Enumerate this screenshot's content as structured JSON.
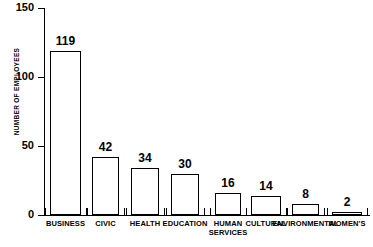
{
  "chart_data": {
    "type": "bar",
    "title": "",
    "xlabel": "",
    "ylabel": "NUMBER OF EMPLOYEES",
    "ylim": [
      0,
      150
    ],
    "yticks": [
      0,
      50,
      100,
      150
    ],
    "grid": false,
    "legend": false,
    "categories": [
      "BUSINESS",
      "CIVIC",
      "HEALTH",
      "EDUCATION",
      "HUMAN SERVICES",
      "CULTURAL",
      "ENVIRONMENTAL",
      "WOMEN'S"
    ],
    "category_lines": [
      [
        "BUSINESS"
      ],
      [
        "CIVIC"
      ],
      [
        "HEALTH"
      ],
      [
        "EDUCATION"
      ],
      [
        "HUMAN",
        "SERVICES"
      ],
      [
        "CULTURAL"
      ],
      [
        "ENVIRONMENTAL"
      ],
      [
        "WOMEN'S"
      ]
    ],
    "values": [
      119,
      42,
      34,
      30,
      16,
      14,
      8,
      2
    ],
    "value_labels": [
      "119",
      "42",
      "34",
      "30",
      "16",
      "14",
      "8",
      "2"
    ],
    "bar_fill": "#ffffff",
    "bar_stroke": "#000000",
    "axis_color": "#000000",
    "text_color": "#000000",
    "background": "#ffffff"
  },
  "ytick_labels": [
    "150",
    "100",
    "50",
    "0"
  ]
}
